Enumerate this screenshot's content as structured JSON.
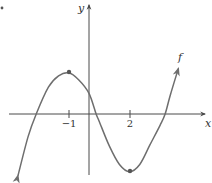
{
  "chart_data": {
    "type": "line",
    "title": "",
    "xlabel": "x",
    "ylabel": "y",
    "function_label": "f",
    "x_ticks": [
      {
        "value": -1,
        "label": "−1"
      },
      {
        "value": 2,
        "label": "2"
      }
    ],
    "y_ticks": [],
    "grid": false,
    "legend": "none",
    "marked_points": [
      {
        "name": "local-maximum",
        "x": -1,
        "y": 2.0
      },
      {
        "name": "local-minimum",
        "x": 2,
        "y": -2.8
      }
    ],
    "x_intercepts_approx": [
      -2.6,
      0.35,
      3.75
    ],
    "y_intercept_approx": 1.0,
    "curve_shape": "cubic with local max at x=-1 and local min at x=2, arrows at both ends",
    "x_range": [
      -3.9,
      5.7
    ],
    "y_range": [
      -3.0,
      5.3
    ],
    "series": [
      {
        "name": "f",
        "x": [
          -3.5,
          -3.0,
          -2.6,
          -2.0,
          -1.5,
          -1.0,
          -0.5,
          0.0,
          0.35,
          0.5,
          1.0,
          1.5,
          2.0,
          2.5,
          3.0,
          3.5,
          3.75,
          4.0,
          4.4
        ],
        "y": [
          -3.0,
          -1.1,
          0.0,
          1.3,
          1.85,
          2.0,
          1.65,
          1.0,
          0.0,
          -0.35,
          -1.55,
          -2.45,
          -2.8,
          -2.45,
          -1.5,
          -0.55,
          0.0,
          0.9,
          2.2
        ]
      }
    ],
    "colors": {
      "curve": "#6e6e6e",
      "axes": "#4a4a4a",
      "labels": "#333333"
    }
  }
}
